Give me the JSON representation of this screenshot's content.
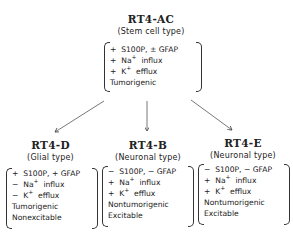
{
  "root": {
    "title": "RT4-AC",
    "subtitle": "(Stem cell type)",
    "lines": [
      {
        "sign": "+",
        "text": "S100P, ± GFAP"
      },
      {
        "sign": "+",
        "ion": "Na",
        "charge": "+",
        "text": "influx"
      },
      {
        "sign": "+",
        "ion": "K",
        "charge": "+",
        "text": "efflux"
      },
      {
        "text": "Tumorigenic"
      }
    ]
  },
  "children": [
    {
      "title": "RT4-D",
      "subtitle": "(Glial type)",
      "lines": [
        {
          "sign": "+",
          "text": "S100P, + GFAP"
        },
        {
          "sign": "−",
          "ion": "Na",
          "charge": "+",
          "text": "influx"
        },
        {
          "sign": "−",
          "ion": "K",
          "charge": "+",
          "text": "efflux"
        },
        {
          "text": "Tumorigenic"
        },
        {
          "text": "Nonexcitable"
        }
      ]
    },
    {
      "title": "RT4-B",
      "subtitle": "(Neuronal type)",
      "lines": [
        {
          "sign": "−",
          "text": "S100P, − GFAP"
        },
        {
          "sign": "+",
          "ion": "Na",
          "charge": "+",
          "text": "influx"
        },
        {
          "sign": "+",
          "ion": "K",
          "charge": "+",
          "text": "efflux"
        },
        {
          "text": "Nontumorigenic"
        },
        {
          "text": "Excitable"
        }
      ]
    },
    {
      "title": "RT4-E",
      "subtitle": "(Neuronal type)",
      "lines": [
        {
          "sign": "−",
          "text": "S100P, − GFAP"
        },
        {
          "sign": "+",
          "ion": "Na",
          "charge": "+",
          "text": "influx"
        },
        {
          "sign": "+",
          "ion": "K",
          "charge": "+",
          "text": "efflux"
        },
        {
          "text": "Nontumorigenic"
        },
        {
          "text": "Excitable"
        }
      ]
    }
  ]
}
